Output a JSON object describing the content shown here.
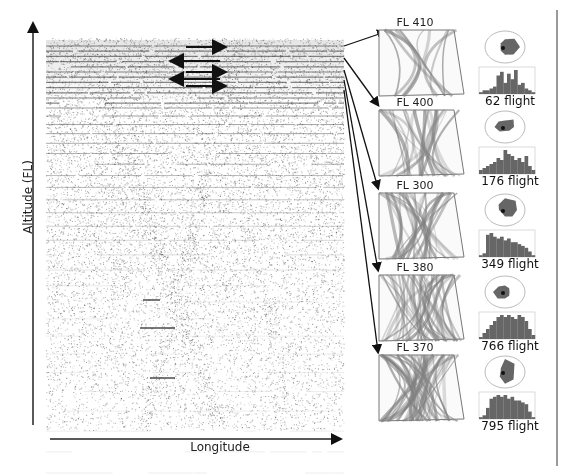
{
  "axes": {
    "y_label": "Altitude (FL)",
    "x_label": "Longitude"
  },
  "direction_arrows": [
    {
      "direction": "right",
      "y": 47
    },
    {
      "direction": "left",
      "y": 61
    },
    {
      "direction": "right",
      "y": 72
    },
    {
      "direction": "left",
      "y": 79
    },
    {
      "direction": "right",
      "y": 86
    }
  ],
  "panels": [
    {
      "title": "FL 410",
      "count_label": "62 flight",
      "top": 30,
      "rose": [
        0.6,
        0.9,
        1.0,
        0.8,
        0.6,
        0.4,
        0.3,
        0.4
      ],
      "hist": [
        1,
        2,
        2,
        3,
        4,
        10,
        12,
        6,
        11,
        8,
        13,
        5,
        6,
        3,
        2,
        1
      ]
    },
    {
      "title": "FL 400",
      "count_label": "176 flight",
      "top": 110,
      "rose": [
        0.5,
        0.8,
        0.6,
        0.4,
        0.3,
        0.5,
        0.7,
        0.6
      ],
      "hist": [
        2,
        3,
        4,
        5,
        6,
        8,
        7,
        12,
        10,
        9,
        7,
        8,
        6,
        9,
        4,
        2
      ]
    },
    {
      "title": "FL 300",
      "count_label": "349 flight",
      "top": 193,
      "rose": [
        0.9,
        1.0,
        0.8,
        0.7,
        0.5,
        0.3,
        0.4,
        0.6
      ],
      "hist": [
        1,
        2,
        12,
        13,
        11,
        10,
        11,
        9,
        10,
        8,
        8,
        7,
        6,
        5,
        3,
        1
      ]
    },
    {
      "title": "FL 380",
      "count_label": "766 flight",
      "top": 275,
      "rose": [
        0.5,
        0.4,
        0.3,
        0.4,
        0.5,
        0.7,
        0.8,
        0.6
      ],
      "hist": [
        1,
        3,
        5,
        7,
        9,
        11,
        12,
        11,
        12,
        11,
        10,
        12,
        11,
        9,
        5,
        2
      ]
    },
    {
      "title": "FL 370",
      "count_label": "795 flight",
      "top": 355,
      "rose": [
        1.0,
        0.9,
        0.6,
        0.8,
        0.9,
        0.5,
        0.3,
        0.4
      ],
      "hist": [
        1,
        2,
        6,
        11,
        12,
        13,
        12,
        13,
        11,
        12,
        10,
        10,
        9,
        8,
        4,
        1
      ]
    }
  ],
  "colors": {
    "arrow": "#111111",
    "density_ink": "#333333",
    "hist_fill": "#666666",
    "rose_fill": "#666666",
    "rose_ring": "#aaaaaa",
    "trail": "#808080",
    "right_rule": "#9a9a9a"
  }
}
